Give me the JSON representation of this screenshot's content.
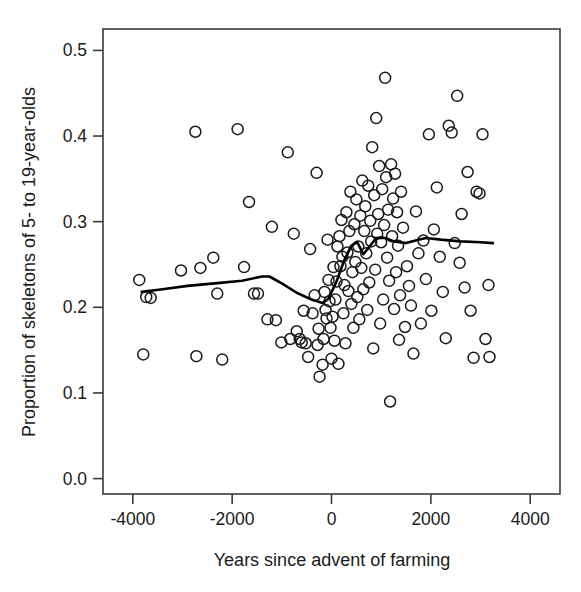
{
  "chart_data": {
    "type": "scatter",
    "title": "",
    "xlabel": "Years since advent of farming",
    "ylabel": "Proportion of skeletons of 5- to 19-year-olds",
    "xlim": [
      -4600,
      4600
    ],
    "ylim": [
      -0.018,
      0.525
    ],
    "xticks": [
      -4000,
      -2000,
      0,
      2000,
      4000
    ],
    "xtick_labels": [
      "-4000",
      "-2000",
      "0",
      "2000",
      "4000"
    ],
    "yticks": [
      0.0,
      0.1,
      0.2,
      0.3,
      0.4,
      0.5
    ],
    "ytick_labels": [
      "0.0",
      "0.1",
      "0.2",
      "0.3",
      "0.4",
      "0.5"
    ],
    "grid": false,
    "legend": false,
    "marker": "open-circle",
    "marker_color": "#1a1a1a",
    "marker_size": 5.5,
    "line_color": "#000000",
    "line_width": 2.6,
    "series": [
      {
        "name": "Skeletal samples",
        "type": "scatter",
        "points": [
          [
            -3870,
            0.232
          ],
          [
            -3730,
            0.212
          ],
          [
            -3640,
            0.211
          ],
          [
            -3790,
            0.145
          ],
          [
            -3030,
            0.243
          ],
          [
            -2740,
            0.405
          ],
          [
            -2640,
            0.246
          ],
          [
            -2720,
            0.143
          ],
          [
            -2380,
            0.258
          ],
          [
            -2300,
            0.216
          ],
          [
            -2200,
            0.139
          ],
          [
            -1890,
            0.408
          ],
          [
            -1760,
            0.247
          ],
          [
            -1660,
            0.323
          ],
          [
            -1560,
            0.216
          ],
          [
            -1480,
            0.216
          ],
          [
            -1290,
            0.186
          ],
          [
            -1200,
            0.294
          ],
          [
            -1120,
            0.185
          ],
          [
            -1010,
            0.159
          ],
          [
            -880,
            0.381
          ],
          [
            -830,
            0.163
          ],
          [
            -760,
            0.286
          ],
          [
            -700,
            0.172
          ],
          [
            -640,
            0.163
          ],
          [
            -600,
            0.159
          ],
          [
            -560,
            0.196
          ],
          [
            -520,
            0.158
          ],
          [
            -470,
            0.142
          ],
          [
            -430,
            0.268
          ],
          [
            -380,
            0.193
          ],
          [
            -340,
            0.214
          ],
          [
            -300,
            0.357
          ],
          [
            -280,
            0.156
          ],
          [
            -260,
            0.175
          ],
          [
            -240,
            0.119
          ],
          [
            -180,
            0.133
          ],
          [
            -160,
            0.163
          ],
          [
            -140,
            0.218
          ],
          [
            -120,
            0.197
          ],
          [
            -100,
            0.187
          ],
          [
            -80,
            0.279
          ],
          [
            -60,
            0.232
          ],
          [
            -40,
            0.207
          ],
          [
            -20,
            0.176
          ],
          [
            0,
            0.14
          ],
          [
            20,
            0.189
          ],
          [
            40,
            0.247
          ],
          [
            60,
            0.161
          ],
          [
            80,
            0.209
          ],
          [
            100,
            0.23
          ],
          [
            120,
            0.271
          ],
          [
            140,
            0.134
          ],
          [
            160,
            0.283
          ],
          [
            180,
            0.248
          ],
          [
            200,
            0.302
          ],
          [
            220,
            0.259
          ],
          [
            240,
            0.193
          ],
          [
            260,
            0.226
          ],
          [
            280,
            0.158
          ],
          [
            300,
            0.311
          ],
          [
            320,
            0.264
          ],
          [
            340,
            0.219
          ],
          [
            360,
            0.289
          ],
          [
            380,
            0.335
          ],
          [
            400,
            0.204
          ],
          [
            420,
            0.241
          ],
          [
            440,
            0.176
          ],
          [
            460,
            0.297
          ],
          [
            480,
            0.253
          ],
          [
            500,
            0.326
          ],
          [
            520,
            0.212
          ],
          [
            540,
            0.271
          ],
          [
            560,
            0.186
          ],
          [
            580,
            0.307
          ],
          [
            600,
            0.246
          ],
          [
            620,
            0.348
          ],
          [
            640,
            0.221
          ],
          [
            660,
            0.289
          ],
          [
            680,
            0.318
          ],
          [
            700,
            0.263
          ],
          [
            720,
            0.197
          ],
          [
            740,
            0.342
          ],
          [
            760,
            0.229
          ],
          [
            780,
            0.301
          ],
          [
            800,
            0.277
          ],
          [
            820,
            0.387
          ],
          [
            840,
            0.152
          ],
          [
            860,
            0.331
          ],
          [
            880,
            0.244
          ],
          [
            900,
            0.421
          ],
          [
            920,
            0.286
          ],
          [
            940,
            0.309
          ],
          [
            960,
            0.365
          ],
          [
            980,
            0.181
          ],
          [
            1000,
            0.276
          ],
          [
            1020,
            0.338
          ],
          [
            1040,
            0.209
          ],
          [
            1060,
            0.296
          ],
          [
            1080,
            0.468
          ],
          [
            1100,
            0.352
          ],
          [
            1120,
            0.258
          ],
          [
            1140,
            0.314
          ],
          [
            1160,
            0.231
          ],
          [
            1180,
            0.09
          ],
          [
            1200,
            0.367
          ],
          [
            1220,
            0.283
          ],
          [
            1240,
            0.327
          ],
          [
            1260,
            0.198
          ],
          [
            1280,
            0.356
          ],
          [
            1300,
            0.241
          ],
          [
            1320,
            0.311
          ],
          [
            1340,
            0.272
          ],
          [
            1360,
            0.162
          ],
          [
            1380,
            0.214
          ],
          [
            1400,
            0.335
          ],
          [
            1440,
            0.293
          ],
          [
            1480,
            0.177
          ],
          [
            1520,
            0.248
          ],
          [
            1560,
            0.225
          ],
          [
            1600,
            0.202
          ],
          [
            1650,
            0.146
          ],
          [
            1700,
            0.312
          ],
          [
            1750,
            0.263
          ],
          [
            1800,
            0.181
          ],
          [
            1850,
            0.278
          ],
          [
            1900,
            0.233
          ],
          [
            1960,
            0.402
          ],
          [
            2010,
            0.196
          ],
          [
            2060,
            0.291
          ],
          [
            2120,
            0.34
          ],
          [
            2180,
            0.259
          ],
          [
            2240,
            0.218
          ],
          [
            2300,
            0.164
          ],
          [
            2360,
            0.412
          ],
          [
            2420,
            0.404
          ],
          [
            2480,
            0.275
          ],
          [
            2530,
            0.447
          ],
          [
            2580,
            0.252
          ],
          [
            2620,
            0.309
          ],
          [
            2680,
            0.223
          ],
          [
            2740,
            0.358
          ],
          [
            2800,
            0.196
          ],
          [
            2860,
            0.141
          ],
          [
            2920,
            0.335
          ],
          [
            2980,
            0.333
          ],
          [
            3040,
            0.402
          ],
          [
            3100,
            0.163
          ],
          [
            3160,
            0.226
          ],
          [
            3180,
            0.142
          ]
        ]
      },
      {
        "name": "LOESS trend",
        "type": "line",
        "points": [
          [
            -3820,
            0.218
          ],
          [
            -3400,
            0.221
          ],
          [
            -2900,
            0.225
          ],
          [
            -2350,
            0.228
          ],
          [
            -1800,
            0.231
          ],
          [
            -1400,
            0.236
          ],
          [
            -1250,
            0.236
          ],
          [
            -1000,
            0.228
          ],
          [
            -700,
            0.217
          ],
          [
            -400,
            0.209
          ],
          [
            -180,
            0.205
          ],
          [
            -60,
            0.21
          ],
          [
            100,
            0.23
          ],
          [
            250,
            0.254
          ],
          [
            400,
            0.272
          ],
          [
            520,
            0.276
          ],
          [
            640,
            0.262
          ],
          [
            780,
            0.272
          ],
          [
            900,
            0.281
          ],
          [
            1080,
            0.281
          ],
          [
            1260,
            0.277
          ],
          [
            1500,
            0.275
          ],
          [
            1750,
            0.279
          ],
          [
            1900,
            0.281
          ],
          [
            2200,
            0.279
          ],
          [
            2600,
            0.277
          ],
          [
            3000,
            0.276
          ],
          [
            3250,
            0.275
          ]
        ]
      }
    ]
  }
}
